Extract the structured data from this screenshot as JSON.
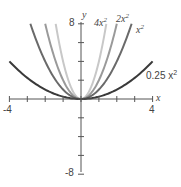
{
  "chart_data": {
    "type": "line",
    "title": "",
    "xlabel": "x",
    "ylabel": "y",
    "xlim": [
      -4,
      4
    ],
    "ylim": [
      -8,
      8
    ],
    "x_tick_labels": [
      "-4",
      "4"
    ],
    "y_tick_labels": [
      "8",
      "-8"
    ],
    "grid": false,
    "series": [
      {
        "name": "4x^2",
        "label": "4x²",
        "coef": 4,
        "color": "#c8c8c8"
      },
      {
        "name": "2x^2",
        "label": "2x²",
        "coef": 2,
        "color": "#9a9a9a"
      },
      {
        "name": "x^2",
        "label": "x²",
        "coef": 1,
        "color": "#6a6a6a"
      },
      {
        "name": "0.25x^2",
        "label": "0.25 x²",
        "coef": 0.25,
        "color": "#3a3a3a"
      }
    ]
  },
  "labels": {
    "x_axis": "x",
    "y_axis": "y",
    "x_min": "-4",
    "x_max": "4",
    "y_max": "8",
    "y_min": "-8",
    "curve_4x2": "4x",
    "curve_2x2": "2x",
    "curve_x2": "x",
    "curve_025x2": "0.25 x",
    "sup": "2"
  }
}
